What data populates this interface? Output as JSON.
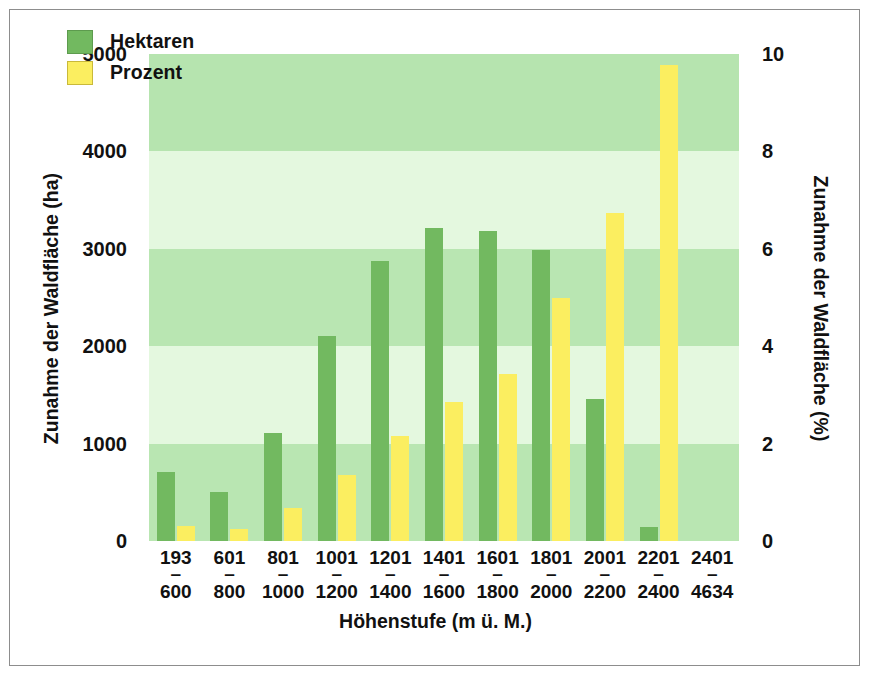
{
  "chart_data": {
    "type": "bar",
    "title": "",
    "xlabel": "Höhenstufe (m ü. M.)",
    "ylabel": "Zunahme der Waldfläche (ha)",
    "y2label": "Zunahme der Waldfläche (%)",
    "categories": [
      {
        "hi": "193",
        "lo": "600"
      },
      {
        "hi": "601",
        "lo": "800"
      },
      {
        "hi": "801",
        "lo": "1000"
      },
      {
        "hi": "1001",
        "lo": "1200"
      },
      {
        "hi": "1201",
        "lo": "1400"
      },
      {
        "hi": "1401",
        "lo": "1600"
      },
      {
        "hi": "1601",
        "lo": "1800"
      },
      {
        "hi": "1801",
        "lo": "2000"
      },
      {
        "hi": "2001",
        "lo": "2200"
      },
      {
        "hi": "2201",
        "lo": "2400"
      },
      {
        "hi": "2401",
        "lo": "4634"
      }
    ],
    "series": [
      {
        "name": "Hektaren",
        "axis": "left",
        "color": "#72b960",
        "values": [
          710,
          500,
          1110,
          2100,
          2880,
          3210,
          3180,
          2990,
          1460,
          140,
          0
        ]
      },
      {
        "name": "Prozent",
        "axis": "right",
        "color": "#fbee60",
        "values": [
          0.3,
          0.25,
          0.68,
          1.35,
          2.15,
          2.85,
          3.43,
          4.98,
          6.73,
          9.78,
          0
        ]
      }
    ],
    "yticks_left": [
      "5000",
      "4000",
      "3000",
      "2000",
      "1000",
      "0"
    ],
    "yticks_right": [
      "10",
      "8",
      "6",
      "4",
      "2",
      "0"
    ],
    "ylim": [
      0,
      5000
    ],
    "y2lim": [
      0,
      10
    ],
    "grid": false,
    "legend_position": "top-left",
    "bands": [
      {
        "from": 4000,
        "to": 5000,
        "color": "#b6e4af"
      },
      {
        "from": 3000,
        "to": 4000,
        "color": "#e4f8df"
      },
      {
        "from": 2000,
        "to": 3000,
        "color": "#b9e6b2"
      },
      {
        "from": 1000,
        "to": 2000,
        "color": "#e4f8df"
      },
      {
        "from": 0,
        "to": 1000,
        "color": "#b9e6b2"
      }
    ]
  },
  "legend": {
    "items": [
      {
        "label": "Hektaren",
        "swatch": "green"
      },
      {
        "label": "Prozent",
        "swatch": "yellow"
      }
    ]
  },
  "colors": {
    "hektaren": "#72b960",
    "prozent": "#fbee60",
    "band_dark": "#b6e4af",
    "band_light": "#e4f8df",
    "frame": "#8d8d8d"
  }
}
